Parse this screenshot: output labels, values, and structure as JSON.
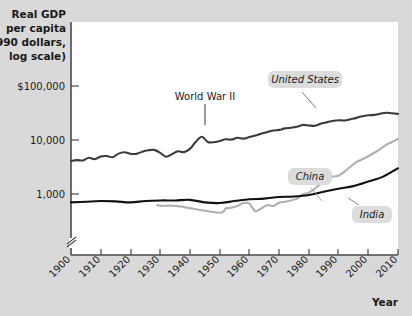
{
  "chart_data": {
    "type": "line",
    "title": "",
    "subtitle": "",
    "ylabel_lines": [
      "Real GDP",
      "per capita",
      "(1990 dollars,",
      "log scale)"
    ],
    "ylabel": "Real GDP per capita (1990 dollars, log scale)",
    "xlabel": "Year",
    "yscale": "log",
    "ylim": [
      500,
      200000
    ],
    "xlim": [
      1900,
      2010
    ],
    "grid": false,
    "legend_position": "inline-callouts",
    "y_tick_labels": [
      "$100,000",
      "10,000",
      "1,000"
    ],
    "y_tick_values": [
      100000,
      10000,
      1000
    ],
    "y_axis_break": true,
    "x_tick_labels": [
      "1900",
      "1910",
      "1920",
      "1930",
      "1940",
      "1950",
      "1960",
      "1970",
      "1980",
      "1990",
      "2000",
      "2010"
    ],
    "x_tick_values": [
      1900,
      1910,
      1920,
      1930,
      1940,
      1950,
      1960,
      1970,
      1980,
      1990,
      2000,
      2010
    ],
    "annotations": [
      {
        "text": "World War II",
        "x": 1944,
        "style": "plain-with-leader"
      }
    ],
    "series": [
      {
        "name": "United States",
        "color": "#3b3b3b",
        "label_style": "italic-callout",
        "x": [
          1900,
          1902,
          1904,
          1906,
          1908,
          1910,
          1912,
          1914,
          1916,
          1918,
          1920,
          1922,
          1924,
          1926,
          1928,
          1930,
          1932,
          1934,
          1936,
          1938,
          1940,
          1942,
          1944,
          1946,
          1948,
          1950,
          1952,
          1954,
          1956,
          1958,
          1960,
          1962,
          1964,
          1966,
          1968,
          1970,
          1972,
          1974,
          1976,
          1978,
          1980,
          1982,
          1984,
          1986,
          1988,
          1990,
          1992,
          1994,
          1996,
          1998,
          2000,
          2002,
          2004,
          2006,
          2008,
          2010
        ],
        "values": [
          4090,
          4240,
          4180,
          4700,
          4420,
          4960,
          5060,
          4800,
          5600,
          5950,
          5550,
          5540,
          6080,
          6440,
          6560,
          5790,
          4900,
          5470,
          6200,
          5970,
          6840,
          9300,
          11500,
          9200,
          9100,
          9560,
          10300,
          10200,
          11000,
          10600,
          11330,
          12100,
          13100,
          14100,
          15000,
          15400,
          16400,
          16800,
          17600,
          19000,
          18600,
          18300,
          20000,
          21200,
          22500,
          23200,
          23000,
          24300,
          25700,
          27600,
          28700,
          29200,
          30700,
          32000,
          31200,
          30500
        ]
      },
      {
        "name": "China",
        "color": "#b0b0b0",
        "label_style": "italic-callout",
        "x": [
          1929,
          1931,
          1933,
          1935,
          1937,
          1939,
          1950,
          1952,
          1954,
          1956,
          1958,
          1960,
          1962,
          1964,
          1966,
          1968,
          1970,
          1972,
          1974,
          1976,
          1978,
          1980,
          1982,
          1984,
          1986,
          1988,
          1990,
          1992,
          1994,
          1996,
          1998,
          2000,
          2002,
          2004,
          2006,
          2008,
          2010
        ],
        "values": [
          620,
          600,
          610,
          600,
          590,
          560,
          450,
          540,
          560,
          600,
          680,
          660,
          480,
          540,
          620,
          600,
          690,
          720,
          760,
          820,
          980,
          1060,
          1250,
          1560,
          1780,
          2100,
          2180,
          2600,
          3200,
          3900,
          4400,
          5000,
          5800,
          6800,
          8100,
          9200,
          10500
        ]
      },
      {
        "name": "India",
        "color": "#111111",
        "label_style": "italic-callout",
        "x": [
          1900,
          1905,
          1910,
          1915,
          1920,
          1925,
          1930,
          1935,
          1940,
          1945,
          1950,
          1955,
          1960,
          1965,
          1970,
          1975,
          1980,
          1985,
          1990,
          1995,
          2000,
          2005,
          2010
        ],
        "values": [
          700,
          720,
          740,
          730,
          700,
          740,
          760,
          760,
          780,
          700,
          680,
          740,
          800,
          820,
          880,
          900,
          960,
          1100,
          1250,
          1400,
          1700,
          2100,
          3000
        ]
      }
    ]
  },
  "labels": {
    "world_war_two": "World War II",
    "united_states": "United States",
    "china": "China",
    "india": "India",
    "year": "Year"
  },
  "colors": {
    "background": "#d9d9d9",
    "plot_background": "#ffffff",
    "axis": "#4a4a4a",
    "united_states": "#3b3b3b",
    "china": "#b0b0b0",
    "india": "#111111",
    "callout_box": "#dcdcdc"
  }
}
